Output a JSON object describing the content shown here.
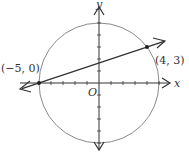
{
  "diagram": {
    "type": "coordinate-plane",
    "circle": {
      "center": [
        0,
        0
      ],
      "radius": 5,
      "color": "#888888"
    },
    "axes": {
      "x_label": "x",
      "y_label": "y",
      "origin_label": "O",
      "tick_spacing": 1
    },
    "line": {
      "color": "#333333",
      "points": [
        [
          -5,
          0
        ],
        [
          4,
          3
        ]
      ]
    },
    "points": [
      {
        "label": "(−5, 0)",
        "x": -5,
        "y": 0
      },
      {
        "label": "(4, 3)",
        "x": 4,
        "y": 3
      }
    ]
  }
}
